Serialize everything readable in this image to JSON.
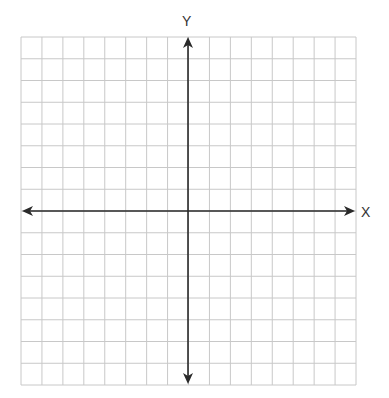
{
  "diagram": {
    "type": "coordinate-plane",
    "x_axis_label": "X",
    "y_axis_label": "Y",
    "grid": {
      "columns": 16,
      "rows": 16,
      "left": 21,
      "right": 356,
      "top": 37,
      "bottom": 385,
      "line_color": "#c8c8c8",
      "line_width": 1
    },
    "axes": {
      "origin_x": 188,
      "origin_y": 211,
      "color": "#2a2a2a",
      "line_width": 1.6,
      "x_start": 22,
      "x_end": 355,
      "y_start": 37,
      "y_end": 384,
      "arrows": [
        "left",
        "right",
        "up",
        "down"
      ]
    },
    "ticks_labeled": false
  }
}
